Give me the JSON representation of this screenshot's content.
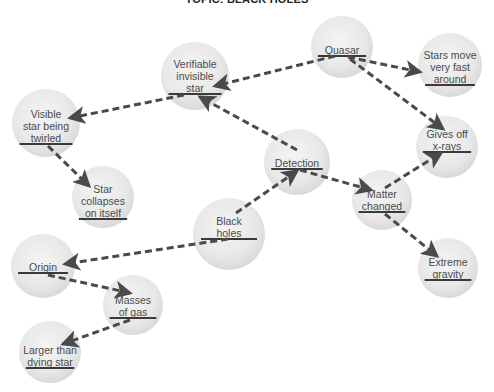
{
  "title": "TOPIC: BLACK HOLES",
  "colors": {
    "node_fill_center": "#f2f2f2",
    "node_fill_edge": "#dcdcdc",
    "edge": "#4a4a4a",
    "text": "#4a4a4a",
    "underline": "#3a3a3a"
  },
  "nodes": [
    {
      "id": "quasar",
      "lines": [
        "Quasar"
      ],
      "cx": 342,
      "cy": 47,
      "r": 31,
      "ul_y": 56
    },
    {
      "id": "stars-move",
      "lines": [
        "Stars move",
        "very fast",
        "around"
      ],
      "cx": 450,
      "cy": 65,
      "r": 32,
      "ul_y": 85
    },
    {
      "id": "verifiable",
      "lines": [
        "Verifiable",
        "invisible",
        "star"
      ],
      "cx": 195,
      "cy": 76,
      "r": 34,
      "ul_y": 94
    },
    {
      "id": "visible-star",
      "lines": [
        "Visible",
        "star being",
        "twirled"
      ],
      "cx": 46,
      "cy": 123,
      "r": 34,
      "ul_y": 144
    },
    {
      "id": "star-collapses",
      "lines": [
        "Star",
        "collapses",
        "on itself"
      ],
      "cx": 103,
      "cy": 197,
      "r": 31,
      "ul_y": 219
    },
    {
      "id": "detection",
      "lines": [
        "Detection"
      ],
      "cx": 297,
      "cy": 162,
      "r": 33,
      "ul_y": 169
    },
    {
      "id": "gives-off",
      "lines": [
        "Gives off",
        "x-rays"
      ],
      "cx": 447,
      "cy": 147,
      "r": 31,
      "ul_y": 152
    },
    {
      "id": "matter-changed",
      "lines": [
        "Matter",
        "changed"
      ],
      "cx": 382,
      "cy": 200,
      "r": 30,
      "ul_y": 212
    },
    {
      "id": "black-holes",
      "lines": [
        "Black",
        "holes"
      ],
      "cx": 229,
      "cy": 234,
      "r": 36,
      "ul_y": 239
    },
    {
      "id": "origin",
      "lines": [
        "Origin"
      ],
      "cx": 43,
      "cy": 266,
      "r": 32,
      "ul_y": 273
    },
    {
      "id": "extreme-gravity",
      "lines": [
        "Extreme",
        "gravity"
      ],
      "cx": 448,
      "cy": 268,
      "r": 30,
      "ul_y": 280
    },
    {
      "id": "masses-of-gas",
      "lines": [
        "Masses",
        "of gas"
      ],
      "cx": 133,
      "cy": 305,
      "r": 30,
      "ul_y": 318
    },
    {
      "id": "larger-than",
      "lines": [
        "Larger than",
        "dying star"
      ],
      "cx": 50,
      "cy": 352,
      "r": 31,
      "ul_y": 368
    }
  ],
  "edges": [
    {
      "from": "quasar",
      "to": "verifiable",
      "x1": 335,
      "y1": 56,
      "x2": 215,
      "y2": 86
    },
    {
      "from": "quasar",
      "to": "stars-move",
      "x1": 348,
      "y1": 57,
      "x2": 420,
      "y2": 72
    },
    {
      "from": "quasar",
      "to": "gives-off",
      "x1": 350,
      "y1": 59,
      "x2": 443,
      "y2": 129
    },
    {
      "from": "verifiable",
      "to": "visible-star",
      "x1": 184,
      "y1": 95,
      "x2": 70,
      "y2": 118
    },
    {
      "from": "detection",
      "to": "verifiable",
      "x1": 297,
      "y1": 150,
      "x2": 200,
      "y2": 97
    },
    {
      "from": "visible-star",
      "to": "star-collapses",
      "x1": 48,
      "y1": 146,
      "x2": 89,
      "y2": 186
    },
    {
      "from": "detection",
      "to": "matter-changed",
      "x1": 300,
      "y1": 170,
      "x2": 371,
      "y2": 190
    },
    {
      "from": "black-holes",
      "to": "detection",
      "x1": 236,
      "y1": 213,
      "x2": 297,
      "y2": 171
    },
    {
      "from": "matter-changed",
      "to": "gives-off",
      "x1": 385,
      "y1": 188,
      "x2": 441,
      "y2": 153
    },
    {
      "from": "matter-changed",
      "to": "extreme-gravity",
      "x1": 385,
      "y1": 214,
      "x2": 437,
      "y2": 256
    },
    {
      "from": "black-holes",
      "to": "origin",
      "x1": 228,
      "y1": 239,
      "x2": 65,
      "y2": 264
    },
    {
      "from": "origin",
      "to": "masses-of-gas",
      "x1": 48,
      "y1": 275,
      "x2": 130,
      "y2": 293
    },
    {
      "from": "masses-of-gas",
      "to": "larger-than",
      "x1": 130,
      "y1": 320,
      "x2": 63,
      "y2": 344
    }
  ]
}
